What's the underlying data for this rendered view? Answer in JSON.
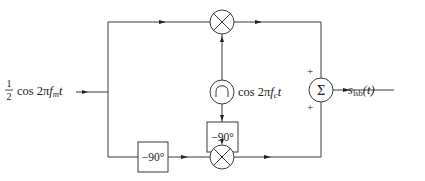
{
  "diagram": {
    "input": {
      "label_fraction_num": "1",
      "label_fraction_den": "2",
      "label_text": "cos 2π",
      "label_var": "f",
      "label_sub": "m",
      "label_t": "t"
    },
    "oscillator": {
      "icon": "sine-wave-oscillator",
      "label_text": "cos 2π",
      "label_var": "f",
      "label_sub": "c",
      "label_t": "t"
    },
    "phase_shifter_carrier": {
      "label": "−90°"
    },
    "phase_shifter_message": {
      "label": "−90°"
    },
    "multiplier_top": {
      "icon": "multiplier-x"
    },
    "multiplier_bottom": {
      "icon": "multiplier-x"
    },
    "summer": {
      "symbol": "Σ",
      "top_sign": "+",
      "bottom_sign": "+"
    },
    "output": {
      "label_var": "s",
      "label_sub": "lsb",
      "label_arg": "(t)"
    },
    "colors": {
      "line": "#3a3a3a",
      "text": "#222222",
      "background": "#ffffff"
    }
  }
}
